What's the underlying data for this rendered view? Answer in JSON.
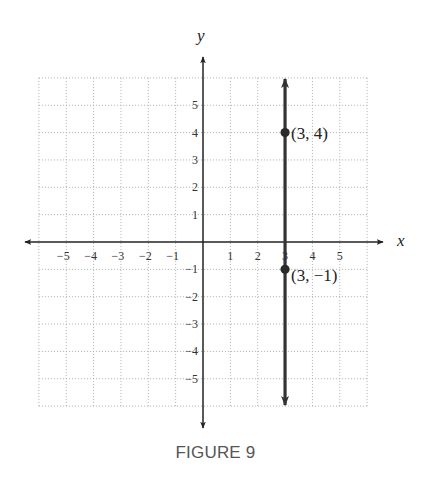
{
  "figure": {
    "caption": "FIGURE 9"
  },
  "chart_data": {
    "type": "line",
    "title": "",
    "xlabel": "x",
    "ylabel": "y",
    "xlim": [
      -6,
      6
    ],
    "ylim": [
      -6,
      6
    ],
    "grid": true,
    "x_ticks": [
      -5,
      -4,
      -3,
      -2,
      -1,
      1,
      2,
      3,
      4,
      5
    ],
    "y_ticks": [
      5,
      4,
      3,
      2,
      1,
      -1,
      -2,
      -3,
      -4,
      -5
    ],
    "x_tick_labels": [
      "−5",
      "−4",
      "−3",
      "−2",
      "−1",
      "1",
      "2",
      "3",
      "4",
      "5"
    ],
    "y_tick_labels": [
      "5",
      "4",
      "3",
      "2",
      "1",
      "−1",
      "−2",
      "−3",
      "−4",
      "−5"
    ],
    "series": [
      {
        "name": "x = 3",
        "kind": "vertical-line",
        "x": 3,
        "arrows": "both",
        "color": "#333333"
      }
    ],
    "points": [
      {
        "x": 3,
        "y": 4,
        "label": "(3, 4)"
      },
      {
        "x": 3,
        "y": -1,
        "label": "(3, −1)"
      }
    ],
    "annotations": [
      "(3, 4)",
      "(3, −1)"
    ]
  }
}
